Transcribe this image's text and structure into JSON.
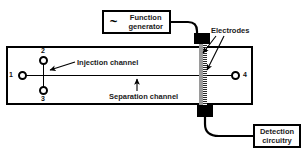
{
  "figure": {
    "type": "schematic-diagram",
    "background_color": "#ffffff",
    "line_color": "#000000",
    "electrode_color": "#9a9a9a"
  },
  "instruments": {
    "function_generator": {
      "label": "Function\ngenerator",
      "symbol": "~",
      "symbol_name": "sine-wave-icon"
    },
    "detection_circuitry": {
      "label": "Detection\ncircuitry"
    }
  },
  "chip": {
    "electrodes_label": "Electrodes",
    "channels": {
      "injection": "Injection channel",
      "separation": "Separation channel"
    },
    "ports": [
      {
        "id": "1",
        "number": "1",
        "name": "reservoir-port-1"
      },
      {
        "id": "2",
        "number": "2",
        "name": "reservoir-port-2"
      },
      {
        "id": "3",
        "number": "3",
        "name": "reservoir-port-3"
      },
      {
        "id": "4",
        "number": "4",
        "name": "reservoir-port-4"
      }
    ]
  }
}
